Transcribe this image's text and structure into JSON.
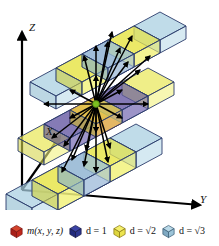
{
  "figure": {
    "title": "",
    "background_color": "#ffffff",
    "width": 219,
    "height": 246
  },
  "axes": {
    "z_label": "Z",
    "x_label": "X",
    "y_label": "Y",
    "axis_color": "#000000"
  },
  "legend": {
    "items": [
      {
        "name": "center-voxel",
        "label": "m(x, y, z)",
        "color": "#b5201c",
        "icon": "red-cube-icon"
      },
      {
        "name": "face-neighbor",
        "label": "d = 1",
        "color": "#2b2f8f",
        "icon": "blue-cube-icon"
      },
      {
        "name": "edge-neighbor",
        "label": "d = √2",
        "color": "#efe04a",
        "icon": "yellow-cube-icon"
      },
      {
        "name": "corner-neighbor",
        "label": "d = √3",
        "color": "#9cc4d8",
        "icon": "lightblue-cube-icon"
      }
    ]
  },
  "colors": {
    "center_red": "#c8331f",
    "center_dot_green": "#7cc020",
    "face_blue": "#5b4f9e",
    "edge_yellow": "#e9e85a",
    "corner_lightblue": "#a8cfe0",
    "edge_stroke": "#2a3b6b",
    "arrow_black": "#000000"
  },
  "scene": {
    "description": "3D voxel neighborhood diagram with three stacked 3x3 layers",
    "layers": [
      {
        "name": "top-layer",
        "z_index": 1,
        "cells": [
          "corner",
          "edge",
          "corner",
          "edge",
          "face",
          "edge",
          "corner",
          "edge",
          "corner"
        ]
      },
      {
        "name": "middle-layer",
        "z_index": 0,
        "cells": [
          "edge",
          "face",
          "edge",
          "face",
          "center",
          "face",
          "edge",
          "face",
          "edge"
        ]
      },
      {
        "name": "bottom-layer",
        "z_index": -1,
        "cells": [
          "corner",
          "edge",
          "corner",
          "edge",
          "face",
          "edge",
          "corner",
          "edge",
          "corner"
        ]
      }
    ],
    "arrow_count": 26
  }
}
